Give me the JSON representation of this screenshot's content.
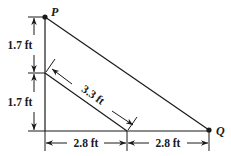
{
  "diagram": {
    "type": "geometry-dimension-figure",
    "points": {
      "P": {
        "label": "P"
      },
      "Q": {
        "label": "Q"
      }
    },
    "dimensions": {
      "left_upper": {
        "label": "1.7 ft",
        "value": 1.7,
        "unit": "ft"
      },
      "left_lower": {
        "label": "1.7 ft",
        "value": 1.7,
        "unit": "ft"
      },
      "diagonal_inner": {
        "label": "3.3 ft",
        "value": 3.3,
        "unit": "ft"
      },
      "bottom_left": {
        "label": "2.8 ft",
        "value": 2.8,
        "unit": "ft"
      },
      "bottom_right": {
        "label": "2.8 ft",
        "value": 2.8,
        "unit": "ft"
      }
    },
    "colors": {
      "line": "#1a1a1a",
      "background": "#ffffff"
    }
  }
}
